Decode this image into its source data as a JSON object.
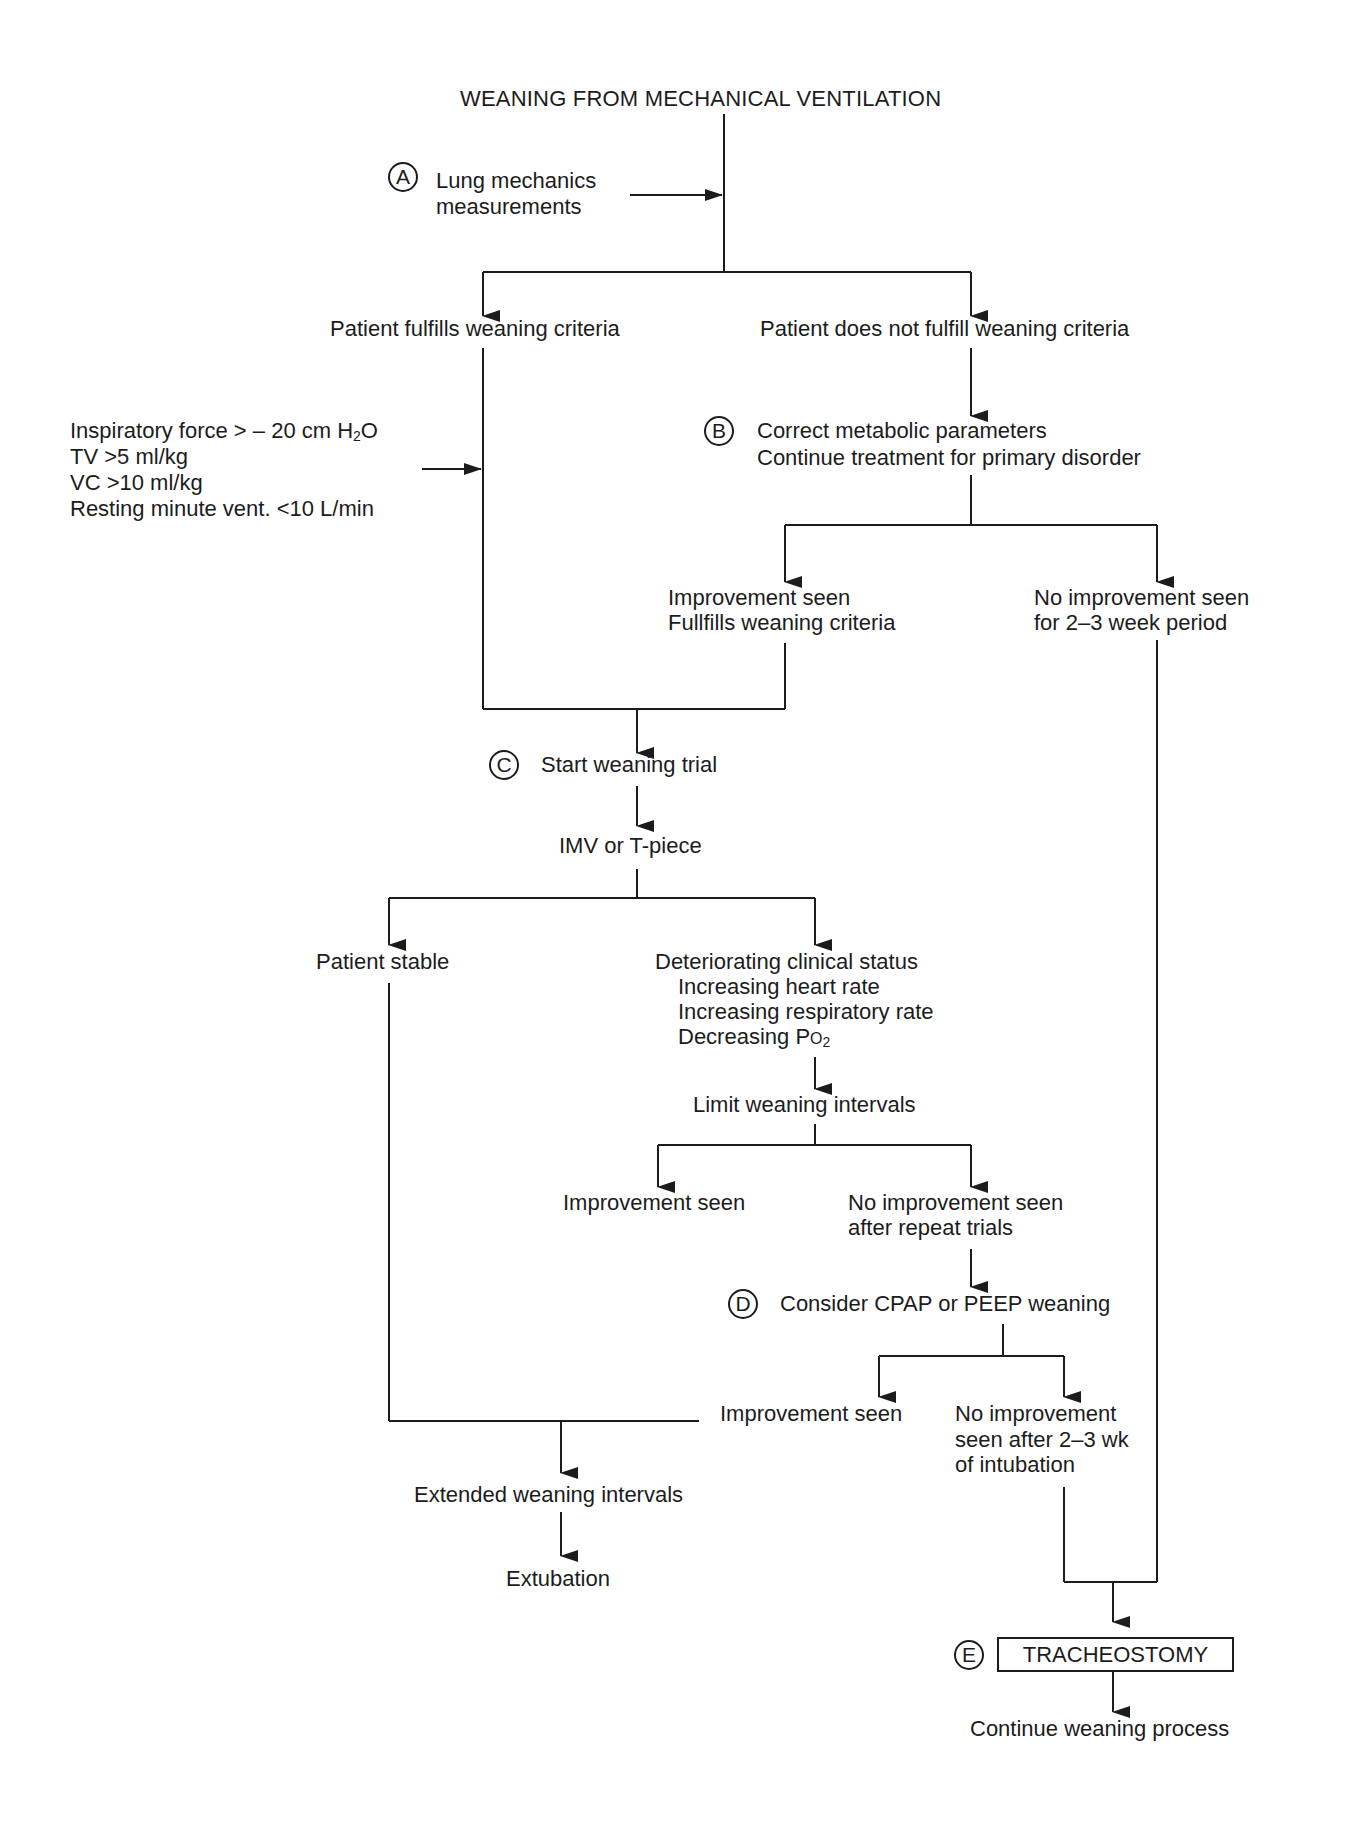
{
  "title": "WEANING FROM MECHANICAL VENTILATION",
  "nodes": {
    "a_marker": "A",
    "a_line1": "Lung mechanics",
    "a_line2": "measurements",
    "fulfills": "Patient fulfills weaning criteria",
    "not_fulfills": "Patient does not fulfill weaning criteria",
    "criteria": {
      "line1_pre": "Inspiratory force > – 20 cm H",
      "line1_sub": "2",
      "line1_post": "O",
      "line2": "TV >5 ml/kg",
      "line3": "VC >10 ml/kg",
      "line4": "Resting minute vent. <10 L/min"
    },
    "b_marker": "B",
    "b_line1": "Correct metabolic parameters",
    "b_line2": "Continue treatment for primary disorder",
    "b_improve_line1": "Improvement seen",
    "b_improve_line2": "Fullfills weaning criteria",
    "b_noimprove_line1": "No improvement seen",
    "b_noimprove_line2": "for 2–3 week period",
    "c_marker": "C",
    "c_label": "Start weaning trial",
    "imv": "IMV or T-piece",
    "stable": "Patient stable",
    "deteriorating": {
      "line1": "Deteriorating clinical status",
      "line2": "Increasing heart rate",
      "line3": "Increasing respiratory rate",
      "line4_pre": "Decreasing P",
      "line4_small": "O",
      "line4_sub": "2"
    },
    "limit": "Limit weaning intervals",
    "limit_improve": "Improvement seen",
    "limit_noimprove_line1": "No improvement seen",
    "limit_noimprove_line2": "after repeat trials",
    "d_marker": "D",
    "d_label": "Consider CPAP or PEEP weaning",
    "d_improve": "Improvement seen",
    "d_noimprove_line1": "No improvement",
    "d_noimprove_line2": "seen after 2–3 wk",
    "d_noimprove_line3": "of intubation",
    "extended": "Extended weaning intervals",
    "extubation": "Extubation",
    "e_marker": "E",
    "e_label": "TRACHEOSTOMY",
    "continue": "Continue weaning process"
  }
}
